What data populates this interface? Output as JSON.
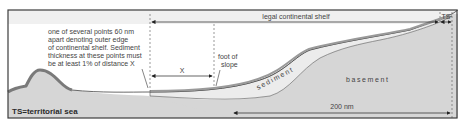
{
  "diagram": {
    "colors": {
      "frame": "#3c3c3c",
      "top_band": "#f0f0f0",
      "sea": "#ffffff",
      "basement": "#d6d6d6",
      "sediment": "#ececec",
      "land_outline": "#7a7a7a",
      "line": "#333333"
    },
    "labels": {
      "legal_shelf": "legal continental shelf",
      "ts": "TS",
      "note_lines": [
        "one of several points 60 nm",
        "apart denoting outer edge",
        "of continental shelf. Sediment",
        "thickness at these points must",
        "be at least 1% of distance X"
      ],
      "x": "X",
      "foot_of_slope_lines": [
        "foot of",
        "slope"
      ],
      "sediment": "sediment",
      "basement": "basement",
      "distance_200": "200 nm",
      "legend": "TS=territorial sea"
    }
  }
}
